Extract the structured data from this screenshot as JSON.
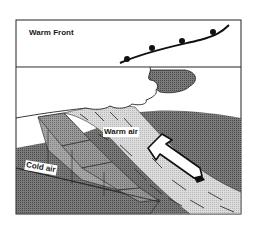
{
  "diagram": {
    "title": "Warm Front",
    "labels": {
      "warm_air": "Warm air",
      "cold_air": "Cold air"
    },
    "symbols": {
      "front_line": "warm-front-symbol",
      "arrow": "warm-air-rising-arrow",
      "cloud": "cloud"
    },
    "colors": {
      "border": "#222222",
      "cloud_fill": "#ffffff",
      "cloud_shadow": "#6a6a6a",
      "cold_air_mass": "#8a8a8a",
      "cold_air_face": "#a0a0a0",
      "cold_air_top": "#b4b4b4",
      "warm_air_band": "#d2d2d2",
      "ground": "#6e6e6e",
      "arrow_fill": "#ffffff"
    }
  }
}
